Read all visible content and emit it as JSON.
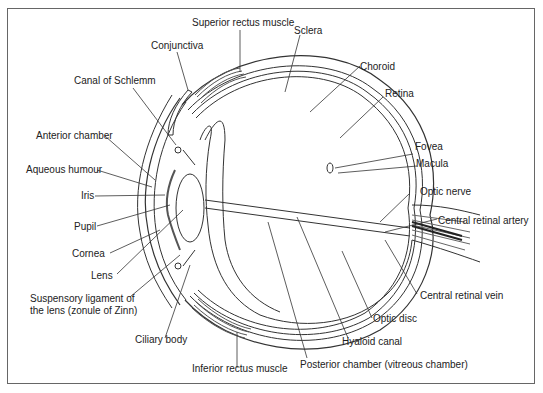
{
  "diagram": {
    "labels": {
      "superior_rectus": "Superior rectus muscle",
      "sclera": "Sclera",
      "conjunctiva": "Conjunctiva",
      "choroid": "Choroid",
      "canal_schlemm": "Canal of Schlemm",
      "retina": "Retina",
      "anterior_chamber": "Anterior chamber",
      "aqueous_humour": "Aqueous humour",
      "fovea": "Fovea",
      "macula": "Macula",
      "iris": "Iris",
      "optic_nerve": "Optic nerve",
      "pupil": "Pupil",
      "central_retinal_artery": "Central retinal artery",
      "cornea": "Cornea",
      "lens": "Lens",
      "central_retinal_vein": "Central retinal vein",
      "suspensory_1": "Suspensory ligament of",
      "suspensory_2": "the lens (zonule of Zinn)",
      "optic_disc": "Optic disc",
      "ciliary_body": "Ciliary body",
      "hyaloid_canal": "Hyaloid canal",
      "inferior_rectus": "Inferior rectus muscle",
      "posterior_chamber": "Posterior chamber (vitreous chamber)"
    }
  }
}
